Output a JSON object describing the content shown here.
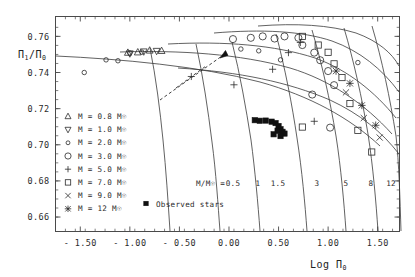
{
  "figure": {
    "title": "",
    "axis_y_label": "Π₁/Π₀",
    "axis_x_label": "Log Π₀"
  },
  "chart_data": {
    "type": "scatter",
    "title": "",
    "xlabel": "Log Π₀",
    "ylabel": "Π₁/Π₀",
    "xlim": [
      -1.75,
      1.72
    ],
    "ylim": [
      0.652,
      0.771
    ],
    "xticks": [
      -1.5,
      -1.0,
      -0.5,
      0.0,
      0.5,
      1.0,
      1.5
    ],
    "xticklabels": [
      "- 1.50",
      "- 1.00",
      "- 0.50",
      "0.00",
      "0.50",
      "1.00",
      "1.50"
    ],
    "yticks": [
      0.66,
      0.68,
      0.7,
      0.72,
      0.74,
      0.76
    ],
    "yticklabels": [
      "0.66",
      "0.68",
      "0.70",
      "0.72",
      "0.74",
      "0.76"
    ],
    "grid": false,
    "legend_position": "lower-left",
    "series": [
      {
        "name": "M = 0.8 M☉",
        "marker": "triangle-up",
        "points": [
          [
            -1.02,
            0.751
          ],
          [
            -0.92,
            0.7512
          ],
          [
            -0.8,
            0.7522
          ],
          [
            -0.68,
            0.752
          ]
        ]
      },
      {
        "name": "M = 1.0 M☉",
        "marker": "triangle-down",
        "points": [
          [
            -1.0,
            0.7505
          ],
          [
            -0.86,
            0.7516
          ],
          [
            -0.73,
            0.7519
          ]
        ]
      },
      {
        "name": "M = 2.0 M☉",
        "marker": "diamond",
        "points": [
          [
            -1.46,
            0.74
          ],
          [
            -1.24,
            0.747
          ],
          [
            -1.12,
            0.7465
          ],
          [
            -1.0,
            0.7508
          ],
          [
            -0.88,
            0.7513
          ],
          [
            0.12,
            0.753
          ],
          [
            0.3,
            0.752
          ],
          [
            0.52,
            0.747
          ],
          [
            1.3,
            0.7455
          ]
        ]
      },
      {
        "name": "M = 3.0 M☉",
        "marker": "circle",
        "points": [
          [
            0.04,
            0.7585
          ],
          [
            0.22,
            0.7592
          ],
          [
            0.34,
            0.76
          ],
          [
            0.46,
            0.7588
          ],
          [
            0.56,
            0.76
          ],
          [
            0.7,
            0.7592
          ],
          [
            0.74,
            0.7552
          ],
          [
            0.86,
            0.751
          ],
          [
            0.92,
            0.7468
          ],
          [
            1.0,
            0.7408
          ],
          [
            1.06,
            0.733
          ],
          [
            0.84,
            0.7278
          ],
          [
            1.02,
            0.7095
          ]
        ]
      },
      {
        "name": "M = 5.0 M☉",
        "marker": "plus",
        "points": [
          [
            -0.38,
            0.7378
          ],
          [
            0.05,
            0.7332
          ],
          [
            0.44,
            0.7418
          ],
          [
            0.6,
            0.751
          ],
          [
            0.72,
            0.7566
          ],
          [
            0.86,
            0.713
          ]
        ]
      },
      {
        "name": "M = 7.0 M☉",
        "marker": "square",
        "points": [
          [
            0.74,
            0.76
          ],
          [
            0.9,
            0.7552
          ],
          [
            1.0,
            0.7512
          ],
          [
            1.06,
            0.7448
          ],
          [
            1.14,
            0.7372
          ],
          [
            1.22,
            0.7228
          ],
          [
            1.3,
            0.708
          ],
          [
            0.74,
            0.7098
          ],
          [
            1.44,
            0.696
          ]
        ]
      },
      {
        "name": "M = 9.0 M☉",
        "marker": "cross",
        "points": [
          [
            1.18,
            0.729
          ],
          [
            1.36,
            0.7148
          ],
          [
            1.52,
            0.704
          ]
        ]
      },
      {
        "name": "M = 12 M☉",
        "marker": "starburst",
        "points": [
          [
            1.08,
            0.7408
          ],
          [
            1.22,
            0.734
          ],
          [
            1.34,
            0.7218
          ],
          [
            1.48,
            0.7108
          ]
        ]
      },
      {
        "name": "Observed stars",
        "marker": "filled-square",
        "points": [
          [
            0.26,
            0.7136
          ],
          [
            0.31,
            0.7133
          ],
          [
            0.37,
            0.7134
          ],
          [
            0.43,
            0.7128
          ],
          [
            0.47,
            0.712
          ],
          [
            0.5,
            0.7104
          ],
          [
            0.52,
            0.7086
          ],
          [
            0.49,
            0.7078
          ],
          [
            0.54,
            0.7072
          ],
          [
            0.56,
            0.7062
          ],
          [
            0.45,
            0.7058
          ],
          [
            0.52,
            0.7048
          ]
        ]
      }
    ],
    "mass_tracks": {
      "label": "M/M☉ =",
      "values": [
        "0.5",
        "1",
        "1.5",
        "3",
        "5",
        "8",
        "12"
      ]
    },
    "annotations": [
      {
        "type": "arrow",
        "style": "dashed",
        "note": "evolutionary direction"
      }
    ]
  },
  "legend": {
    "entries": [
      {
        "marker": "triangle-up",
        "label": "M = 0.8 M☉"
      },
      {
        "marker": "triangle-down",
        "label": "M = 1.0 M☉"
      },
      {
        "marker": "diamond",
        "label": "M = 2.0 M☉"
      },
      {
        "marker": "circle",
        "label": "M = 3.0 M☉"
      },
      {
        "marker": "plus",
        "label": "M = 5.0 M☉"
      },
      {
        "marker": "square",
        "label": "M = 7.0 M☉"
      },
      {
        "marker": "cross",
        "label": "M = 9.0 M☉"
      },
      {
        "marker": "starburst",
        "label": "M =  12 M☉"
      }
    ],
    "observed": {
      "marker": "filled-square",
      "label": "Observed stars"
    }
  }
}
